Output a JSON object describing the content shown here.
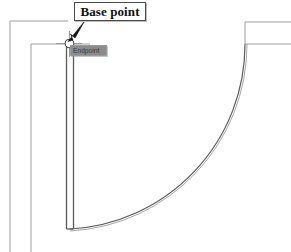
{
  "drawing": {
    "title": "Door swing plan detail",
    "annotations": {
      "callout_label": "Base point",
      "osnap_tooltip_label": "Endpoint"
    },
    "colors": {
      "line": "#5a5a5a",
      "line_light": "#9e9e9e",
      "arrow": "#111111",
      "callout_border": "#4a4a4a",
      "callout_fill": "#ffffff",
      "tooltip_fill": "#8c8c8c",
      "tooltip_text": "#3a3a3a",
      "background": "#ffffff"
    },
    "geometry": {
      "base_point": {
        "x": 68,
        "y": 43
      },
      "snap_marker": "endpoint-circle",
      "cursor": "crosshair",
      "outer_wall_corner": {
        "x": 10,
        "y": 21
      },
      "inner_wall_corner": {
        "x": 31,
        "y": 44
      },
      "door_panel": {
        "x1": 66,
        "x2": 74,
        "y_top": 43,
        "y_bottom": 228
      },
      "arc": {
        "center_x": 70,
        "center_y": 44,
        "radius": 185
      },
      "right_wall": {
        "x": 245,
        "y_top": 22,
        "y_bottom": 44
      }
    }
  }
}
